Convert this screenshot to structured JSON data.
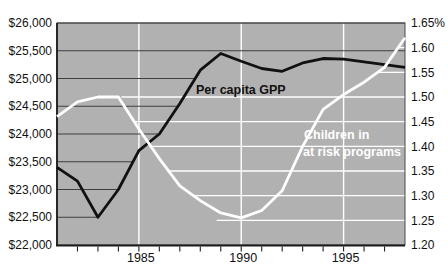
{
  "chart_data": {
    "type": "line",
    "title": "",
    "x_range": [
      1981,
      1998
    ],
    "years": [
      1981,
      1982,
      1983,
      1984,
      1985,
      1986,
      1987,
      1988,
      1989,
      1990,
      1991,
      1992,
      1993,
      1994,
      1995,
      1996,
      1997,
      1998
    ],
    "x_minor_tick_years": [
      1982,
      1983,
      1984,
      1985,
      1986,
      1987,
      1988,
      1989,
      1990,
      1991,
      1992,
      1993,
      1994,
      1995,
      1996,
      1997
    ],
    "x_tick_labels": [
      {
        "year": 1985,
        "label": "1985"
      },
      {
        "year": 1990,
        "label": "1990"
      },
      {
        "year": 1995,
        "label": "1995"
      }
    ],
    "left_axis": {
      "min": 22000,
      "max": 26000,
      "step": 500,
      "tick_labels": [
        "$26,000",
        "$25,500",
        "$25,000",
        "$24,500",
        "$24,000",
        "$23,500",
        "$23,000",
        "$22,500",
        "$22,000"
      ]
    },
    "right_axis": {
      "min": 1.2,
      "max": 1.65,
      "step": 0.05,
      "tick_labels": [
        "1.65%",
        "1.60",
        "1.55",
        "1.50",
        "1.45",
        "1.40",
        "1.35",
        "1.30",
        "1.25",
        "1.20"
      ]
    },
    "series": [
      {
        "name": "Per capita GPP",
        "axis": "left",
        "color": "#111111",
        "values": [
          23400,
          23150,
          22500,
          23000,
          23700,
          24000,
          24550,
          25150,
          25450,
          25310,
          25180,
          25130,
          25280,
          25360,
          25350,
          25300,
          25250,
          25200
        ]
      },
      {
        "name": "Children in at risk programs",
        "axis": "right",
        "color": "#ffffff",
        "values": [
          1.46,
          1.49,
          1.5,
          1.5,
          1.435,
          1.375,
          1.32,
          1.29,
          1.265,
          1.255,
          1.27,
          1.31,
          1.4,
          1.475,
          1.505,
          1.53,
          1.56,
          1.62
        ]
      }
    ],
    "grid": {
      "vertical_white_years": [
        1985,
        1990,
        1995
      ],
      "dark_horizontal": [
        {
          "value": 26000,
          "end_year": 1998
        },
        {
          "value": 25500,
          "end_year": 1998
        },
        {
          "value": 25000,
          "end_year": 1987.75
        },
        {
          "value": 24500,
          "end_year": 1986.9
        },
        {
          "value": 24000,
          "end_year": 1986
        },
        {
          "value": 23500,
          "end_year": 1984.7
        },
        {
          "value": 23000,
          "end_year": 1984
        },
        {
          "value": 22500,
          "end_year": 1983
        }
      ],
      "white_horizontal": [
        {
          "value": 1.6,
          "start_year": 1997.7
        },
        {
          "value": 1.55,
          "start_year": 1996.65
        },
        {
          "value": 1.5,
          "start_year": 1984.15
        },
        {
          "value": 1.45,
          "start_year": 1984.77
        },
        {
          "value": 1.4,
          "start_year": 1985.6
        },
        {
          "value": 1.35,
          "start_year": 1986.45
        },
        {
          "value": 1.3,
          "start_year": 1987.65
        },
        {
          "value": 1.25,
          "start_year": 1988.8
        }
      ]
    },
    "annotations": {
      "gpp_label": "Per capita GPP",
      "children_label_line1": "Children in",
      "children_label_line2": "at risk programs"
    },
    "legend": "none",
    "colors": {
      "plot_bg": "#b1b1b1",
      "dark_grid": "#3f3f3f",
      "white_grid": "#ffffff",
      "axis": "#1c1c1c",
      "text": "#111111"
    }
  }
}
